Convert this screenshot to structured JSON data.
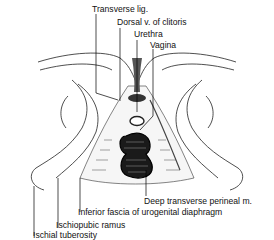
{
  "figure": {
    "labels": {
      "transverse_lig": "Transverse lig.",
      "dorsal_vein": "Dorsal v. of clitoris",
      "urethra": "Urethra",
      "vagina": "Vagina",
      "deep_transverse": "Deep transverse perineal m.",
      "inferior_fascia": "Inferior fascia of urogenital diaphragm",
      "ischiopubic_ramus": "Ischiopubic ramus",
      "ischial_tuberosity": "Ischial tuberosity"
    }
  }
}
